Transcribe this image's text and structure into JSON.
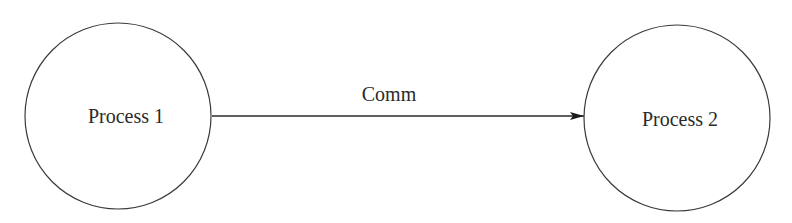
{
  "diagram": {
    "nodes": [
      {
        "id": "p1",
        "label": "Process 1",
        "shape": "circle"
      },
      {
        "id": "p2",
        "label": "Process 2",
        "shape": "circle"
      }
    ],
    "edges": [
      {
        "from": "p1",
        "to": "p2",
        "label": "Comm",
        "directed": true
      }
    ],
    "colors": {
      "stroke": "#3a3a3a",
      "background": "#ffffff"
    }
  }
}
